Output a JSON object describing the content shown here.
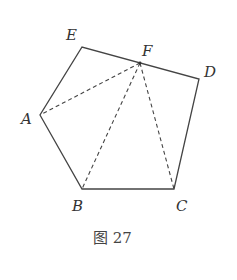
{
  "figure": {
    "caption": "图 27",
    "points": {
      "A": {
        "label": "A",
        "x": 40,
        "y": 115
      },
      "B": {
        "label": "B",
        "x": 82,
        "y": 189
      },
      "C": {
        "label": "C",
        "x": 174,
        "y": 189
      },
      "D": {
        "label": "D",
        "x": 199,
        "y": 79
      },
      "E": {
        "label": "E",
        "x": 82,
        "y": 47
      },
      "F": {
        "label": "F",
        "x": 140,
        "y": 63
      }
    },
    "solid_edges": [
      [
        "A",
        "B"
      ],
      [
        "B",
        "C"
      ],
      [
        "C",
        "D"
      ],
      [
        "D",
        "E"
      ],
      [
        "E",
        "A"
      ]
    ],
    "dashed_edges": [
      [
        "F",
        "A"
      ],
      [
        "F",
        "B"
      ],
      [
        "F",
        "C"
      ]
    ],
    "stroke_color": "#444444"
  }
}
